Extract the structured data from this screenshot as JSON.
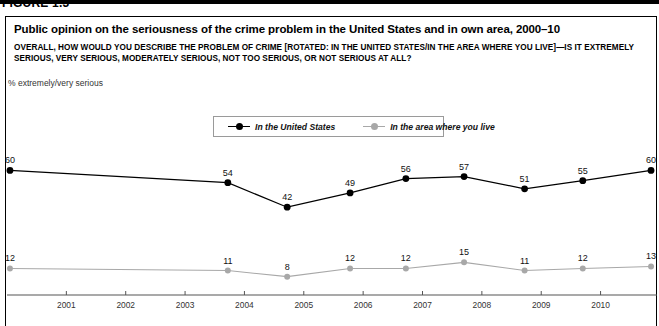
{
  "figure": {
    "number": "FIGURE 1.3",
    "title": "Public opinion on the seriousness of the crime problem in the United States and in own area, 2000–10",
    "question": "OVERALL, HOW WOULD YOU DESCRIBE THE PROBLEM OF CRIME [ROTATED: IN THE UNITED STATES/IN THE AREA WHERE YOU LIVE]—IS IT EXTREMELY SERIOUS, VERY SERIOUS, MODERATELY SERIOUS, NOT TOO SERIOUS, OR NOT SERIOUS AT ALL?",
    "axis_note": "% extremely/very serious"
  },
  "legend": {
    "position": "top-center",
    "items": [
      {
        "label": "In the United States",
        "color": "#000000"
      },
      {
        "label": "In the area where you live",
        "color": "#a8a8a8"
      }
    ]
  },
  "colors": {
    "series_us": "#000000",
    "series_own": "#a8a8a8",
    "axis": "#555555",
    "frame": "#000000",
    "label_text": "#111111"
  },
  "chart_data": {
    "type": "line",
    "title": "Public opinion on the seriousness of the crime problem in the United States and in own area, 2000–10",
    "subtitle": "OVERALL, HOW WOULD YOU DESCRIBE THE PROBLEM OF CRIME [ROTATED: IN THE UNITED STATES/IN THE AREA WHERE YOU LIVE]—IS IT EXTREMELY SERIOUS, VERY SERIOUS, MODERATELY SERIOUS, NOT TOO SERIOUS, OR NOT SERIOUS AT ALL?",
    "xlabel": "",
    "ylabel": "% extremely/very serious",
    "grid": false,
    "legend_position": "top-center",
    "xlim": [
      2000.0,
      2010.9
    ],
    "ylim": [
      0,
      70
    ],
    "xticks": [
      "2001",
      "2002",
      "2003",
      "2004",
      "2005",
      "2006",
      "2007",
      "2008",
      "2009",
      "2010"
    ],
    "x": [
      2000.05,
      2003.72,
      2004.72,
      2005.78,
      2006.72,
      2007.7,
      2008.72,
      2009.7,
      2010.85
    ],
    "series": [
      {
        "name": "In the United States",
        "color": "#000000",
        "values": [
          60,
          54,
          42,
          49,
          56,
          57,
          51,
          55,
          60
        ]
      },
      {
        "name": "In the area where you live",
        "color": "#a8a8a8",
        "values": [
          12,
          11,
          8,
          12,
          12,
          15,
          11,
          12,
          13
        ]
      }
    ]
  }
}
